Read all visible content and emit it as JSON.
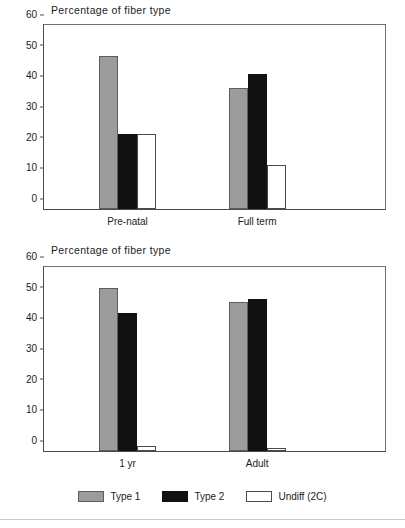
{
  "figure": {
    "background_color": "#ffffff",
    "series_colors": {
      "type1": "#9c9c9c",
      "type2": "#111111",
      "undiff": "#ffffff",
      "outline": "#4a4a4a"
    }
  },
  "legend": {
    "position": "bottom-center",
    "items": [
      {
        "label": "Type 1",
        "swatch": "filled-gray-swatch"
      },
      {
        "label": "Type 2",
        "swatch": "filled-black-swatch"
      },
      {
        "label": "Undiff (2C)",
        "swatch": "outlined-white-swatch"
      }
    ]
  },
  "chart_data": [
    {
      "id": "top",
      "type": "bar",
      "title": "Percentage of fiber type",
      "xlabel": "",
      "ylabel": "",
      "ylim": [
        0,
        60
      ],
      "yticks": [
        0,
        10,
        20,
        30,
        40,
        50,
        60
      ],
      "ytick_labels": [
        "0",
        "10",
        "20",
        "30",
        "40",
        "50",
        "60"
      ],
      "grid": false,
      "categories": [
        "Pre-natal",
        "Full term"
      ],
      "series": [
        {
          "name": "Type 1",
          "values": [
            50,
            39.5
          ]
        },
        {
          "name": "Type 2",
          "values": [
            24.5,
            44
          ]
        },
        {
          "name": "Undiff (2C)",
          "values": [
            24.5,
            14.5
          ]
        }
      ]
    },
    {
      "id": "bottom",
      "type": "bar",
      "title": "Percentage of fiber type",
      "xlabel": "",
      "ylabel": "",
      "ylim": [
        0,
        60
      ],
      "yticks": [
        0,
        10,
        20,
        30,
        40,
        50,
        60
      ],
      "ytick_labels": [
        "0",
        "10",
        "20",
        "30",
        "40",
        "50",
        "60"
      ],
      "grid": false,
      "categories": [
        "1 yr",
        "Adult"
      ],
      "series": [
        {
          "name": "Type 1",
          "values": [
            53,
            48.5
          ]
        },
        {
          "name": "Type 2",
          "values": [
            45,
            49.5
          ]
        },
        {
          "name": "Undiff (2C)",
          "values": [
            1.5,
            1
          ]
        }
      ]
    }
  ]
}
